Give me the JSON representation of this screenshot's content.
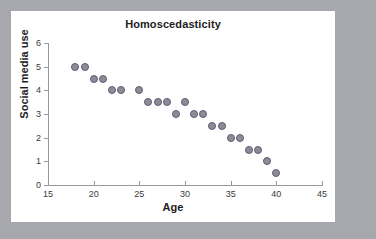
{
  "canvas": {
    "background_color": "#a7a8ad",
    "panel_color": "#ffffff"
  },
  "chart_data": {
    "type": "scatter",
    "title": "Homoscedasticity",
    "xlabel": "Age",
    "ylabel": "Social media use",
    "xlim": [
      15,
      45
    ],
    "ylim": [
      0,
      6
    ],
    "xticks": [
      15,
      20,
      25,
      30,
      35,
      40,
      45
    ],
    "yticks": [
      0,
      1,
      2,
      3,
      4,
      5,
      6
    ],
    "xtick_labels": [
      "15",
      "20",
      "25",
      "30",
      "35",
      "40",
      "45"
    ],
    "ytick_labels": [
      "0",
      "1",
      "2",
      "3",
      "4",
      "5",
      "6"
    ],
    "grid": false,
    "legend": null,
    "marker_color": "#8c8c99",
    "marker_edge_color": "#5d5d70",
    "x": [
      18,
      19,
      20,
      21,
      22,
      23,
      25,
      26,
      27,
      28,
      29,
      30,
      31,
      32,
      33,
      34,
      35,
      36,
      37,
      38,
      39,
      40
    ],
    "y": [
      5,
      5,
      4.5,
      4.5,
      4,
      4,
      4,
      3.5,
      3.5,
      3.5,
      3,
      3.5,
      3,
      3,
      2.5,
      2.5,
      2,
      2,
      1.5,
      1.5,
      1,
      0.5
    ],
    "points": [
      {
        "x": 18,
        "y": 5
      },
      {
        "x": 19,
        "y": 5
      },
      {
        "x": 20,
        "y": 4.5
      },
      {
        "x": 21,
        "y": 4.5
      },
      {
        "x": 22,
        "y": 4
      },
      {
        "x": 23,
        "y": 4
      },
      {
        "x": 25,
        "y": 4
      },
      {
        "x": 26,
        "y": 3.5
      },
      {
        "x": 27,
        "y": 3.5
      },
      {
        "x": 28,
        "y": 3.5
      },
      {
        "x": 29,
        "y": 3
      },
      {
        "x": 30,
        "y": 3.5
      },
      {
        "x": 31,
        "y": 3
      },
      {
        "x": 32,
        "y": 3
      },
      {
        "x": 33,
        "y": 2.5
      },
      {
        "x": 34,
        "y": 2.5
      },
      {
        "x": 35,
        "y": 2
      },
      {
        "x": 36,
        "y": 2
      },
      {
        "x": 37,
        "y": 1.5
      },
      {
        "x": 38,
        "y": 1.5
      },
      {
        "x": 39,
        "y": 1
      },
      {
        "x": 40,
        "y": 0.5
      }
    ]
  }
}
